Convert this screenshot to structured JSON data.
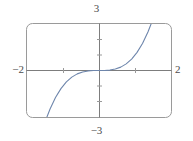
{
  "figure": {
    "kind": "graphing-window",
    "frame": {
      "stroke_color": "#9a9a9a",
      "corner_radius": 6
    },
    "axes": {
      "stroke_color": "#7d7d7d",
      "tick_color": "#9a9a9a"
    },
    "labels": {
      "y_max": "3",
      "y_min": "−3",
      "x_min": "−2",
      "x_max": "2"
    }
  },
  "chart_data": {
    "type": "line",
    "title": "",
    "xlabel": "",
    "ylabel": "",
    "xlim": [
      -2,
      2
    ],
    "ylim": [
      -3,
      3
    ],
    "grid": false,
    "legend": null,
    "x_ticks": [
      -1,
      1
    ],
    "y_ticks": [
      -2,
      -1,
      1,
      2
    ],
    "x_tick_labels": [
      "−2",
      "2"
    ],
    "y_tick_labels": [
      "−3",
      "3"
    ],
    "curve_color": "#6e86ac",
    "curve_width": 1,
    "series": [
      {
        "name": "y = x^3",
        "expression": "y = x^3",
        "x": [
          -1.442,
          -1.35,
          -1.2,
          -1.05,
          -0.9,
          -0.75,
          -0.6,
          -0.45,
          -0.3,
          -0.15,
          0.0,
          0.15,
          0.3,
          0.45,
          0.6,
          0.75,
          0.9,
          1.05,
          1.2,
          1.35,
          1.442
        ],
        "y": [
          -3.0,
          -2.46,
          -1.728,
          -1.158,
          -0.729,
          -0.422,
          -0.216,
          -0.091,
          -0.027,
          -0.003,
          0.0,
          0.003,
          0.027,
          0.091,
          0.216,
          0.422,
          0.729,
          1.158,
          1.728,
          2.46,
          3.0
        ]
      }
    ]
  }
}
